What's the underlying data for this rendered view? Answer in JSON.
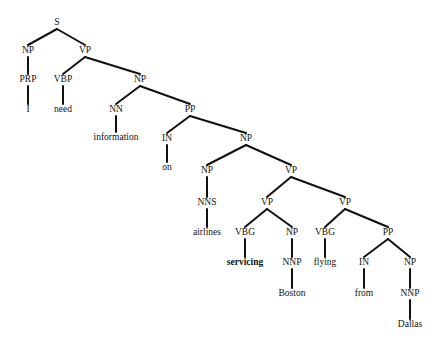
{
  "diagram": {
    "type": "parse-tree",
    "colors": {
      "ink": "#111111",
      "background": "#ffffff"
    },
    "nodes": [
      {
        "id": "n0",
        "label": "S",
        "x": 57,
        "y": 23
      },
      {
        "id": "n1",
        "label": "NP",
        "x": 28,
        "y": 51
      },
      {
        "id": "n2",
        "label": "VP",
        "x": 85,
        "y": 51
      },
      {
        "id": "n3",
        "label": "PRP",
        "x": 28,
        "y": 80
      },
      {
        "id": "n4",
        "label": "I",
        "x": 28,
        "y": 110,
        "leaf": true
      },
      {
        "id": "n5",
        "label": "VBP",
        "x": 63,
        "y": 80
      },
      {
        "id": "n6",
        "label": "need",
        "x": 63,
        "y": 110,
        "leaf": true
      },
      {
        "id": "n7",
        "label": "NP",
        "x": 140,
        "y": 80
      },
      {
        "id": "n8",
        "label": "NN",
        "x": 116,
        "y": 110
      },
      {
        "id": "n9",
        "label": "information",
        "x": 116,
        "y": 138,
        "leaf": true
      },
      {
        "id": "n10",
        "label": "PP",
        "x": 190,
        "y": 110
      },
      {
        "id": "n11",
        "label": "IN",
        "x": 167,
        "y": 139
      },
      {
        "id": "n12",
        "label": "on",
        "x": 167,
        "y": 168,
        "leaf": true
      },
      {
        "id": "n13",
        "label": "NP",
        "x": 246,
        "y": 139
      },
      {
        "id": "n14",
        "label": "NP",
        "x": 207,
        "y": 171
      },
      {
        "id": "n15",
        "label": "NNS",
        "x": 207,
        "y": 203
      },
      {
        "id": "n16",
        "label": "airlines",
        "x": 207,
        "y": 233,
        "leaf": true
      },
      {
        "id": "n17",
        "label": "VP",
        "x": 291,
        "y": 171
      },
      {
        "id": "n18",
        "label": "VP",
        "x": 267,
        "y": 203
      },
      {
        "id": "n19",
        "label": "VBG",
        "x": 245,
        "y": 233
      },
      {
        "id": "n20",
        "label": "servicing",
        "x": 245,
        "y": 263,
        "leaf": true,
        "bold": true
      },
      {
        "id": "n21",
        "label": "NP",
        "x": 292,
        "y": 233
      },
      {
        "id": "n22",
        "label": "NNP",
        "x": 292,
        "y": 263
      },
      {
        "id": "n23",
        "label": "Boston",
        "x": 292,
        "y": 294,
        "leaf": true
      },
      {
        "id": "n24",
        "label": "VP",
        "x": 345,
        "y": 203
      },
      {
        "id": "n25",
        "label": "VBG",
        "x": 325,
        "y": 233
      },
      {
        "id": "n26",
        "label": "flying",
        "x": 325,
        "y": 263,
        "leaf": true
      },
      {
        "id": "n27",
        "label": "PP",
        "x": 388,
        "y": 233
      },
      {
        "id": "n28",
        "label": "IN",
        "x": 364,
        "y": 263
      },
      {
        "id": "n29",
        "label": "from",
        "x": 364,
        "y": 294,
        "leaf": true
      },
      {
        "id": "n30",
        "label": "NP",
        "x": 410,
        "y": 263
      },
      {
        "id": "n31",
        "label": "NNP",
        "x": 410,
        "y": 294
      },
      {
        "id": "n32",
        "label": "Dallas",
        "x": 410,
        "y": 325,
        "leaf": true
      }
    ],
    "edges": [
      [
        "n0",
        "n1"
      ],
      [
        "n0",
        "n2"
      ],
      [
        "n1",
        "n3"
      ],
      [
        "n3",
        "n4"
      ],
      [
        "n2",
        "n5"
      ],
      [
        "n5",
        "n6"
      ],
      [
        "n2",
        "n7"
      ],
      [
        "n7",
        "n8"
      ],
      [
        "n8",
        "n9"
      ],
      [
        "n7",
        "n10"
      ],
      [
        "n10",
        "n11"
      ],
      [
        "n11",
        "n12"
      ],
      [
        "n10",
        "n13"
      ],
      [
        "n13",
        "n14"
      ],
      [
        "n14",
        "n15"
      ],
      [
        "n15",
        "n16"
      ],
      [
        "n13",
        "n17"
      ],
      [
        "n17",
        "n18"
      ],
      [
        "n18",
        "n19"
      ],
      [
        "n19",
        "n20"
      ],
      [
        "n18",
        "n21"
      ],
      [
        "n21",
        "n22"
      ],
      [
        "n22",
        "n23"
      ],
      [
        "n17",
        "n24"
      ],
      [
        "n24",
        "n25"
      ],
      [
        "n25",
        "n26"
      ],
      [
        "n24",
        "n27"
      ],
      [
        "n27",
        "n28"
      ],
      [
        "n28",
        "n29"
      ],
      [
        "n27",
        "n30"
      ],
      [
        "n30",
        "n31"
      ],
      [
        "n31",
        "n32"
      ]
    ]
  }
}
